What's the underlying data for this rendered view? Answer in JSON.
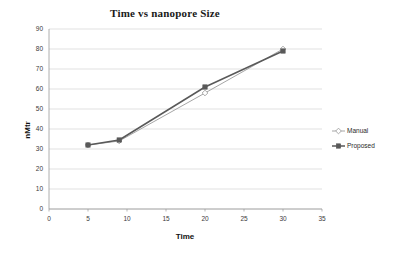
{
  "chart_data": {
    "type": "line",
    "title": "Time vs nanopore Size",
    "xlabel": "Time",
    "ylabel": "nMtr",
    "x": [
      5,
      9,
      20,
      30
    ],
    "series": [
      {
        "name": "Manual",
        "values": [
          32,
          34,
          58,
          80
        ],
        "color": "#a6a6a6",
        "marker": "diamond-open"
      },
      {
        "name": "Proposed",
        "values": [
          32,
          34.5,
          61,
          79
        ],
        "color": "#595959",
        "marker": "square-filled"
      }
    ],
    "xlim": [
      0,
      35
    ],
    "ylim": [
      0,
      90
    ],
    "xticks": [
      "0",
      "5",
      "10",
      "15",
      "20",
      "25",
      "30",
      "35"
    ],
    "yticks": [
      "0",
      "10",
      "20",
      "30",
      "40",
      "50",
      "60",
      "70",
      "80",
      "90"
    ],
    "grid": true,
    "grid_axis": "y",
    "legend_position": "right"
  },
  "legend": {
    "items": [
      {
        "label": "Manual"
      },
      {
        "label": "Proposed"
      }
    ]
  },
  "axes": {
    "y_title": "nMtr",
    "x_title": "Time"
  }
}
